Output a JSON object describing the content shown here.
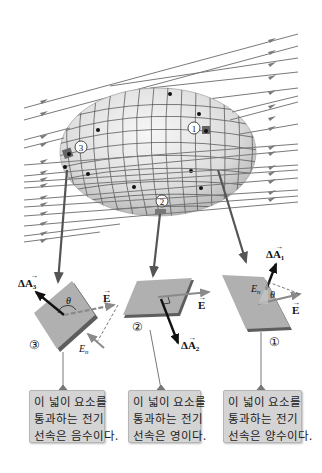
{
  "figure": {
    "field_line_color": "#7a7a7a",
    "surface_fill": "#e6e6e6",
    "grid_color": "#4a4a4a",
    "element_fill": "#a9a9a9"
  },
  "surface_markers": {
    "m1": "1",
    "m2": "2",
    "m3": "3"
  },
  "panels": [
    {
      "id": "3",
      "number_label": "③",
      "area_vector_label": "ΔA",
      "area_vector_sub": "3",
      "field_label": "E",
      "normal_component_label": "E",
      "normal_component_sub": "n",
      "angle_label": "θ"
    },
    {
      "id": "2",
      "number_label": "②",
      "area_vector_label": "ΔA",
      "area_vector_sub": "2",
      "field_label": "E"
    },
    {
      "id": "1",
      "number_label": "①",
      "area_vector_label": "ΔA",
      "area_vector_sub": "1",
      "field_label": "E",
      "normal_component_label": "E",
      "normal_component_sub": "n",
      "angle_label": "θ"
    }
  ],
  "captions": [
    {
      "line1": "이 넓이 요소를",
      "line2": "통과하는 전기",
      "line3": "선속은 음수이다."
    },
    {
      "line1": "이 넓이 요소를",
      "line2": "통과하는 전기",
      "line3": "선속은 영이다."
    },
    {
      "line1": "이 넓이 요소를",
      "line2": "통과하는 전기",
      "line3": "선속은 양수이다."
    }
  ]
}
